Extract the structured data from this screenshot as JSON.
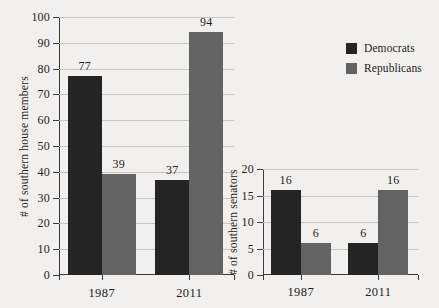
{
  "figure": {
    "background_color": "#f2f0ee",
    "legend": {
      "position": "top-right",
      "entries": [
        {
          "label": "Democrats",
          "color": "#242424"
        },
        {
          "label": "Republicans",
          "color": "#636363"
        }
      ]
    }
  },
  "chart_data": [
    {
      "type": "bar",
      "id": "house",
      "title": "",
      "xlabel": "",
      "ylabel": "# of southern house members",
      "categories": [
        "1987",
        "2011"
      ],
      "series": [
        {
          "name": "Democrats",
          "color": "#242424",
          "values": [
            77,
            37
          ]
        },
        {
          "name": "Republicans",
          "color": "#636363",
          "values": [
            39,
            94
          ]
        }
      ],
      "ylim": [
        0,
        100
      ],
      "yticks": [
        0,
        10,
        20,
        30,
        40,
        50,
        60,
        70,
        80,
        90,
        100
      ],
      "ytick_labels": [
        "0",
        "10",
        "20",
        "30",
        "40",
        "50",
        "60",
        "70",
        "80",
        "90",
        "100"
      ],
      "grid": true,
      "data_labels": [
        "77",
        "39",
        "37",
        "94"
      ],
      "legend": [
        "Democrats",
        "Republicans"
      ]
    },
    {
      "type": "bar",
      "id": "senate",
      "title": "",
      "xlabel": "",
      "ylabel": "# of southern senators",
      "categories": [
        "1987",
        "2011"
      ],
      "series": [
        {
          "name": "Democrats",
          "color": "#242424",
          "values": [
            16,
            6
          ]
        },
        {
          "name": "Republicans",
          "color": "#636363",
          "values": [
            6,
            16
          ]
        }
      ],
      "ylim": [
        0,
        20
      ],
      "yticks": [
        0,
        5,
        10,
        15,
        20
      ],
      "ytick_labels": [
        "0",
        "5",
        "10",
        "15",
        "20"
      ],
      "grid": true,
      "data_labels": [
        "16",
        "6",
        "6",
        "16"
      ],
      "legend": [
        "Democrats",
        "Republicans"
      ]
    }
  ]
}
